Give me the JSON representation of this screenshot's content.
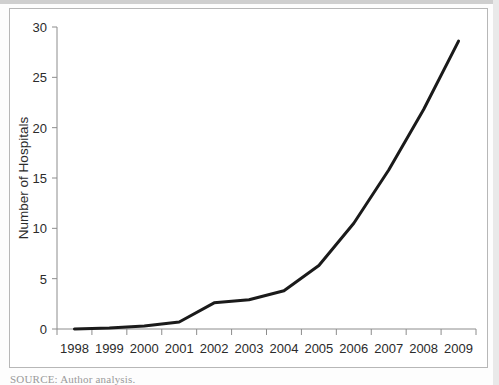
{
  "figure": {
    "source_note": "SOURCE: Author analysis.",
    "frame_color": "#b7b7b7",
    "line_color": "#1a1a1a",
    "axis_color": "#8c8c8c"
  },
  "chart_data": {
    "type": "line",
    "title": "",
    "xlabel": "",
    "ylabel": "Number of Hospitals",
    "categories": [
      "1998",
      "1999",
      "2000",
      "2001",
      "2002",
      "2003",
      "2004",
      "2005",
      "2006",
      "2007",
      "2008",
      "2009"
    ],
    "values": [
      0,
      0.1,
      0.3,
      0.7,
      2.6,
      2.9,
      3.8,
      6.3,
      10.5,
      15.8,
      21.8,
      28.6
    ],
    "series": [
      {
        "name": "Number of Hospitals",
        "values": [
          0,
          0.1,
          0.3,
          0.7,
          2.6,
          2.9,
          3.8,
          6.3,
          10.5,
          15.8,
          21.8,
          28.6
        ]
      }
    ],
    "yticks": [
      0,
      5,
      10,
      15,
      20,
      25,
      30
    ],
    "ytick_labels": [
      "0",
      "5",
      "10",
      "15",
      "20",
      "25",
      "30"
    ],
    "ylim": [
      0,
      30
    ],
    "grid": false,
    "legend": false,
    "legend_position": "none",
    "marker": "none",
    "line_width": 3
  }
}
